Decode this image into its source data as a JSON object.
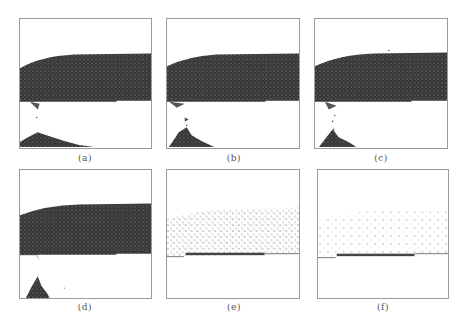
{
  "figure": {
    "panels": [
      {
        "id": "a",
        "caption": "(a)",
        "state": "dense particle layer, small pile below"
      },
      {
        "id": "b",
        "caption": "(b)",
        "state": "dense particle layer, pile growing"
      },
      {
        "id": "c",
        "caption": "(c)",
        "state": "dense particle layer, falling stream and pile"
      },
      {
        "id": "d",
        "caption": "(d)",
        "state": "dense particle layer, scattered pile"
      },
      {
        "id": "e",
        "caption": "(e)",
        "state": "sparse particle layer over platform"
      },
      {
        "id": "f",
        "caption": "(f)",
        "state": "very sparse particle layer over platform"
      }
    ],
    "colors": {
      "frame": "#9a9a9a",
      "particles": "#2b2b2b",
      "caption": "#555555",
      "background": "#ffffff"
    }
  }
}
